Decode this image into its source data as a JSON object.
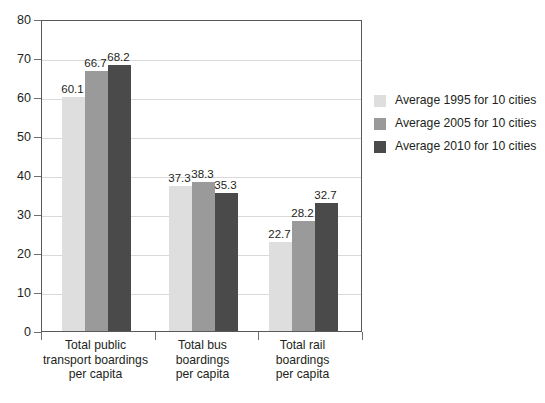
{
  "chart_data": {
    "type": "bar",
    "title": "",
    "xlabel": "",
    "ylabel": "",
    "ylim": [
      0,
      80
    ],
    "yticks": [
      0,
      10,
      20,
      30,
      40,
      50,
      60,
      70,
      80
    ],
    "grid": true,
    "legend_position": "right",
    "categories": [
      "Total public\ntransport boardings\nper capita",
      "Total bus\nboardings\nper capita",
      "Total rail\nboardings\nper capita"
    ],
    "series": [
      {
        "name": "Average 1995 for 10 cities",
        "color": "#dedede",
        "values": [
          60.1,
          66.7,
          68.2
        ]
      },
      {
        "name": "Average 2005 for 10 cities",
        "color": "#9a9a9a",
        "values": [
          37.3,
          38.3,
          35.3
        ]
      },
      {
        "name": "Average 2010 for 10 cities",
        "color": "#4a4a4a",
        "values": [
          22.7,
          28.2,
          32.7
        ]
      }
    ],
    "groups": [
      {
        "category": "Total public\ntransport boardings\nper capita",
        "bars": [
          {
            "series": "Average 1995 for 10 cities",
            "value": 60.1,
            "label": "60.1",
            "color": "#dedede"
          },
          {
            "series": "Average 2005 for 10 cities",
            "value": 66.7,
            "label": "66.7",
            "color": "#9a9a9a"
          },
          {
            "series": "Average 2010 for 10 cities",
            "value": 68.2,
            "label": "68.2",
            "color": "#4a4a4a"
          }
        ]
      },
      {
        "category": "Total bus\nboardings\nper capita",
        "bars": [
          {
            "series": "Average 1995 for 10 cities",
            "value": 37.3,
            "label": "37.3",
            "color": "#dedede"
          },
          {
            "series": "Average 2005 for 10 cities",
            "value": 38.3,
            "label": "38.3",
            "color": "#9a9a9a"
          },
          {
            "series": "Average 2010 for 10 cities",
            "value": 35.3,
            "label": "35.3",
            "color": "#4a4a4a"
          }
        ]
      },
      {
        "category": "Total rail\nboardings\nper capita",
        "bars": [
          {
            "series": "Average 1995 for 10 cities",
            "value": 22.7,
            "label": "22.7",
            "color": "#dedede"
          },
          {
            "series": "Average 2005 for 10 cities",
            "value": 28.2,
            "label": "28.2",
            "color": "#9a9a9a"
          },
          {
            "series": "Average 2010 for 10 cities",
            "value": 32.7,
            "label": "32.7",
            "color": "#4a4a4a"
          }
        ]
      }
    ]
  },
  "axis": {
    "tick_labels": [
      "0",
      "10",
      "20",
      "30",
      "40",
      "50",
      "60",
      "70",
      "80"
    ]
  },
  "legend": {
    "items": [
      {
        "label": "Average 1995 for 10 cities",
        "color": "#dedede"
      },
      {
        "label": "Average 2005 for 10 cities",
        "color": "#9a9a9a"
      },
      {
        "label": "Average 2010 for 10 cities",
        "color": "#4a4a4a"
      }
    ]
  },
  "caption": {
    "text": ""
  },
  "colors": {
    "axis": "#58595b",
    "grid": "#d9d9d9",
    "text": "#231f20",
    "background": "#ffffff"
  }
}
